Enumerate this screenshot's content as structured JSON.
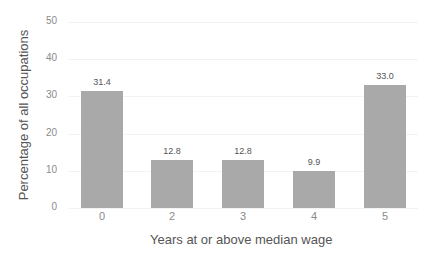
{
  "chart_data": {
    "type": "bar",
    "title": "",
    "xlabel": "Years at or above median wage",
    "ylabel": "Percentage of all occupations",
    "categories": [
      "0",
      "2",
      "3",
      "4",
      "5"
    ],
    "values": [
      31.4,
      12.8,
      12.8,
      9.9,
      33.0
    ],
    "value_labels": [
      "31.4",
      "12.8",
      "12.8",
      "9.9",
      "33.0"
    ],
    "ylim": [
      0,
      50
    ],
    "yticks": [
      "0",
      "10",
      "20",
      "30",
      "40",
      "50"
    ],
    "grid": true,
    "legend": null,
    "bar_color": "#a9a9a9"
  }
}
